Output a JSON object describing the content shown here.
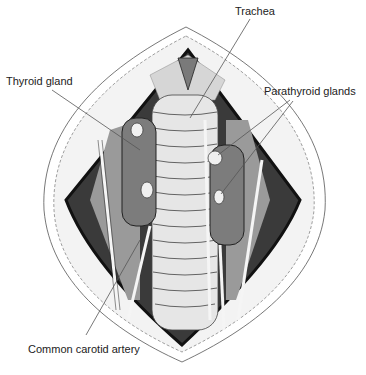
{
  "diagram": {
    "type": "anatomical-illustration",
    "labels": [
      {
        "id": "trachea",
        "text": "Trachea",
        "x": 235,
        "y": 5
      },
      {
        "id": "thyroid",
        "text": "Thyroid gland",
        "x": 6,
        "y": 75
      },
      {
        "id": "parathyroid",
        "text": "Parathyroid glands",
        "x": 264,
        "y": 85
      },
      {
        "id": "carotid",
        "text": "Common carotid artery",
        "x": 28,
        "y": 343
      }
    ],
    "colors": {
      "skin": "#ffffff",
      "skin_edge": "#f2f2f2",
      "outline": "#111111",
      "muscle": "#8a8a8a",
      "dark_cavity": "#2a2a2a",
      "thyroid": "#7c7c7c",
      "trachea": "#e4e4e4",
      "trachea_ring": "#555555",
      "vessel": "#f5f5f5",
      "leader": "#555555"
    }
  }
}
